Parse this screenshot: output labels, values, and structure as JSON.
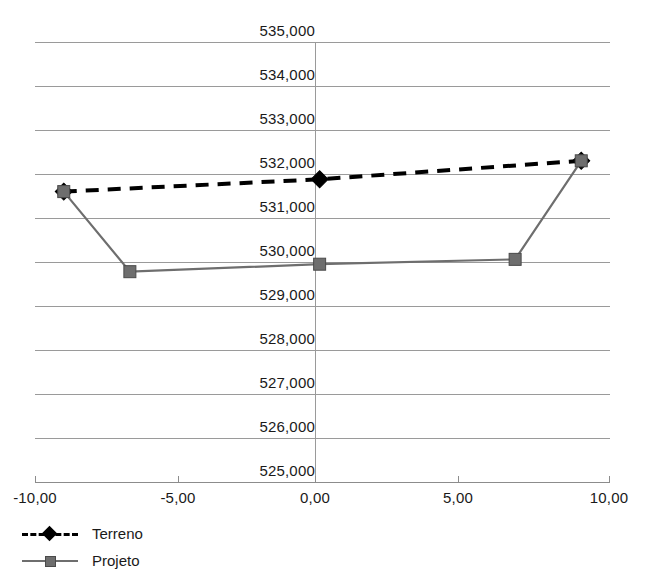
{
  "chart_data": {
    "type": "line",
    "title": "",
    "subtitle": "",
    "xlabel": "",
    "ylabel": "",
    "xlim": [
      -10.0,
      10.0
    ],
    "ylim": [
      525000,
      535000
    ],
    "grid": true,
    "legend_position": "bottom-left",
    "x_tick_labels": [
      "-10,00",
      "-5,00",
      "0,00",
      "5,00",
      "10,00"
    ],
    "x_ticks": [
      -10.0,
      -5.0,
      0.0,
      5.0,
      10.0
    ],
    "y_tick_labels": [
      "535,000",
      "534,000",
      "533,000",
      "532,000",
      "531,000",
      "530,000",
      "529,000",
      "528,000",
      "527,000",
      "526,000",
      "525,000"
    ],
    "y_ticks": [
      535000,
      534000,
      533000,
      532000,
      531000,
      530000,
      529000,
      528000,
      527000,
      526000,
      525000
    ],
    "series": [
      {
        "name": "Terreno",
        "color": "#000000",
        "line_style": "dashed",
        "marker": "diamond",
        "x": [
          -9.0,
          -0.1,
          9.0
        ],
        "values": [
          531600,
          531880,
          532300
        ]
      },
      {
        "name": "Projeto",
        "color": "#6e6e6e",
        "line_style": "solid",
        "marker": "square",
        "x": [
          -9.0,
          -6.7,
          -0.1,
          6.7,
          9.0
        ],
        "values": [
          531600,
          529780,
          529950,
          530060,
          532300
        ]
      }
    ]
  },
  "legend": {
    "items": [
      {
        "label": "Terreno"
      },
      {
        "label": "Projeto"
      }
    ]
  },
  "axes": {
    "y_labels": [
      "535,000",
      "534,000",
      "533,000",
      "532,000",
      "531,000",
      "530,000",
      "529,000",
      "528,000",
      "527,000",
      "526,000",
      "525,000"
    ],
    "x_labels": [
      "-10,00",
      "-5,00",
      "0,00",
      "5,00",
      "10,00"
    ]
  },
  "colors": {
    "terreno": "#000000",
    "projeto": "#6e6e6e",
    "gridline": "#9a9a9a",
    "background": "#ffffff"
  }
}
